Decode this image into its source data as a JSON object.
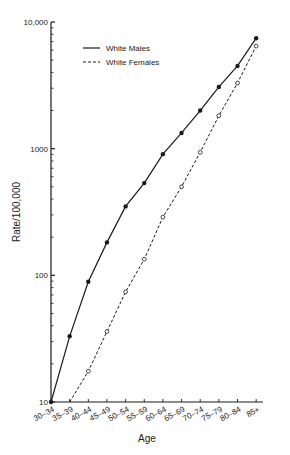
{
  "chart_data": {
    "type": "line",
    "title": "",
    "xlabel": "Age",
    "ylabel": "Rate/100,000",
    "yscale": "log",
    "ylim": [
      10,
      10000
    ],
    "y_ticks": [
      10,
      100,
      1000,
      10000
    ],
    "y_tick_labels": [
      "10",
      "100",
      "1000",
      "10,000"
    ],
    "grid": false,
    "legend_position": "upper left",
    "categories": [
      "30-34",
      "35-39",
      "40-44",
      "45-49",
      "50-54",
      "55-59",
      "60-64",
      "65-69",
      "70-74",
      "75-79",
      "80-84",
      "85+"
    ],
    "series": [
      {
        "name": "White Males",
        "line_style": "solid",
        "marker": "filled-circle",
        "values": [
          10,
          33,
          89,
          182,
          350,
          535,
          905,
          1330,
          2000,
          3070,
          4500,
          7450
        ]
      },
      {
        "name": "White Females",
        "line_style": "dashed",
        "marker": "open-circle",
        "values": [
          null,
          10,
          17.5,
          36,
          74,
          134,
          288,
          500,
          935,
          1820,
          3300,
          6450
        ]
      }
    ]
  },
  "colors": {
    "ink": "#1a1a1a",
    "background": "#ffffff"
  }
}
